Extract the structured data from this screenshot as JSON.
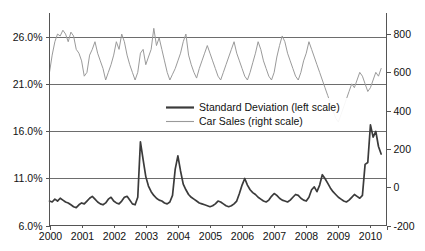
{
  "chart_data": {
    "type": "line",
    "title": "",
    "subtitle": "",
    "xlabel": "",
    "ylabel": "",
    "grid": true,
    "legend_position": "center",
    "x_tick_labels": [
      "2000",
      "2001",
      "2002",
      "2003",
      "2004",
      "2005",
      "2006",
      "2007",
      "2008",
      "2009",
      "2010"
    ],
    "x_tick_values": [
      2000,
      2001,
      2002,
      2003,
      2004,
      2005,
      2006,
      2007,
      2008,
      2009,
      2010
    ],
    "xlim": [
      2000.0,
      2010.5
    ],
    "left_axis": {
      "label": "",
      "ylim": [
        6.0,
        28.6
      ],
      "tick_labels": [
        "6.0%",
        "11.0%",
        "16.0%",
        "21.0%",
        "26.0%"
      ],
      "tick_values": [
        6.0,
        11.0,
        16.0,
        21.0,
        26.0
      ],
      "units": "percent"
    },
    "right_axis": {
      "label": "",
      "ylim": [
        -200,
        910
      ],
      "tick_labels": [
        "-200",
        "0",
        "200",
        "400",
        "600",
        "800"
      ],
      "tick_values": [
        -200,
        0,
        200,
        400,
        600,
        800
      ],
      "units": "thousands"
    },
    "series": [
      {
        "name": "Standard Deviation (left scale)",
        "axis": "left",
        "color": "#3b3b3b",
        "line_width": 1.7,
        "x": [
          2000.0,
          2000.083,
          2000.167,
          2000.25,
          2000.333,
          2000.417,
          2000.5,
          2000.583,
          2000.667,
          2000.75,
          2000.833,
          2000.917,
          2001.0,
          2001.083,
          2001.167,
          2001.25,
          2001.333,
          2001.417,
          2001.5,
          2001.583,
          2001.667,
          2001.75,
          2001.833,
          2001.917,
          2002.0,
          2002.083,
          2002.167,
          2002.25,
          2002.333,
          2002.417,
          2002.5,
          2002.583,
          2002.667,
          2002.75,
          2002.833,
          2002.917,
          2003.0,
          2003.083,
          2003.167,
          2003.25,
          2003.333,
          2003.417,
          2003.5,
          2003.583,
          2003.667,
          2003.75,
          2003.833,
          2003.917,
          2004.0,
          2004.083,
          2004.167,
          2004.25,
          2004.333,
          2004.417,
          2004.5,
          2004.583,
          2004.667,
          2004.75,
          2004.833,
          2004.917,
          2005.0,
          2005.083,
          2005.167,
          2005.25,
          2005.333,
          2005.417,
          2005.5,
          2005.583,
          2005.667,
          2005.75,
          2005.833,
          2005.917,
          2006.0,
          2006.083,
          2006.167,
          2006.25,
          2006.333,
          2006.417,
          2006.5,
          2006.583,
          2006.667,
          2006.75,
          2006.833,
          2006.917,
          2007.0,
          2007.083,
          2007.167,
          2007.25,
          2007.333,
          2007.417,
          2007.5,
          2007.583,
          2007.667,
          2007.75,
          2007.833,
          2007.917,
          2008.0,
          2008.083,
          2008.167,
          2008.25,
          2008.333,
          2008.417,
          2008.5,
          2008.583,
          2008.667,
          2008.75,
          2008.833,
          2008.917,
          2009.0,
          2009.083,
          2009.167,
          2009.25,
          2009.333,
          2009.417,
          2009.5,
          2009.583,
          2009.667,
          2009.75,
          2009.833,
          2009.917,
          2010.0,
          2010.083,
          2010.167,
          2010.25,
          2010.333
        ],
        "values": [
          8.6,
          8.5,
          8.8,
          8.6,
          8.9,
          8.7,
          8.5,
          8.4,
          8.2,
          8.0,
          7.9,
          8.2,
          8.4,
          8.3,
          8.6,
          8.9,
          9.1,
          8.8,
          8.5,
          8.3,
          8.2,
          8.4,
          8.8,
          9.0,
          8.6,
          8.4,
          8.3,
          8.6,
          9.0,
          9.1,
          8.7,
          8.3,
          8.2,
          9.0,
          14.9,
          13.0,
          11.2,
          10.2,
          9.6,
          9.2,
          8.9,
          8.7,
          8.6,
          8.4,
          8.3,
          8.5,
          9.2,
          12.0,
          13.4,
          11.8,
          10.4,
          9.8,
          9.3,
          9.0,
          8.8,
          8.6,
          8.4,
          8.3,
          8.2,
          8.1,
          8.0,
          8.1,
          8.3,
          8.6,
          8.5,
          8.3,
          8.1,
          8.0,
          8.1,
          8.3,
          8.6,
          9.4,
          10.3,
          11.0,
          10.3,
          9.8,
          9.5,
          9.3,
          9.0,
          8.8,
          8.6,
          8.5,
          8.7,
          9.1,
          9.4,
          9.2,
          8.9,
          8.7,
          8.6,
          8.5,
          8.7,
          9.0,
          9.3,
          9.2,
          8.9,
          8.7,
          8.6,
          9.0,
          9.8,
          10.1,
          9.6,
          10.3,
          11.4,
          11.0,
          10.5,
          10.0,
          9.6,
          9.3,
          9.0,
          8.8,
          8.6,
          8.5,
          8.7,
          9.0,
          9.3,
          9.1,
          8.9,
          9.2,
          12.5,
          12.7,
          16.7,
          15.4,
          16.0,
          14.4,
          13.6
        ]
      },
      {
        "name": "Car Sales (right scale)",
        "axis": "right",
        "color": "#9a9a9a",
        "line_width": 1.0,
        "x": [
          2000.0,
          2000.083,
          2000.167,
          2000.25,
          2000.333,
          2000.417,
          2000.5,
          2000.583,
          2000.667,
          2000.75,
          2000.833,
          2000.917,
          2001.0,
          2001.083,
          2001.167,
          2001.25,
          2001.333,
          2001.417,
          2001.5,
          2001.583,
          2001.667,
          2001.75,
          2001.833,
          2001.917,
          2002.0,
          2002.083,
          2002.167,
          2002.25,
          2002.333,
          2002.417,
          2002.5,
          2002.583,
          2002.667,
          2002.75,
          2002.833,
          2002.917,
          2003.0,
          2003.083,
          2003.167,
          2003.25,
          2003.333,
          2003.417,
          2003.5,
          2003.583,
          2003.667,
          2003.75,
          2003.833,
          2003.917,
          2004.0,
          2004.083,
          2004.167,
          2004.25,
          2004.333,
          2004.417,
          2004.5,
          2004.583,
          2004.667,
          2004.75,
          2004.833,
          2004.917,
          2005.0,
          2005.083,
          2005.167,
          2005.25,
          2005.333,
          2005.417,
          2005.5,
          2005.583,
          2005.667,
          2005.75,
          2005.833,
          2005.917,
          2006.0,
          2006.083,
          2006.167,
          2006.25,
          2006.333,
          2006.417,
          2006.5,
          2006.583,
          2006.667,
          2006.75,
          2006.833,
          2006.917,
          2007.0,
          2007.083,
          2007.167,
          2007.25,
          2007.333,
          2007.417,
          2007.5,
          2007.583,
          2007.667,
          2007.75,
          2007.833,
          2007.917,
          2008.0,
          2008.083,
          2008.167,
          2008.25,
          2008.333,
          2008.417,
          2008.5,
          2008.583,
          2008.667,
          2008.75,
          2008.833,
          2008.917,
          2009.0,
          2009.083,
          2009.167,
          2009.25,
          2009.333,
          2009.417,
          2009.5,
          2009.583,
          2009.667,
          2009.75,
          2009.833,
          2009.917,
          2010.0,
          2010.083,
          2010.167,
          2010.25,
          2010.333
        ],
        "values": [
          600,
          690,
          760,
          800,
          790,
          820,
          800,
          760,
          810,
          790,
          720,
          700,
          660,
          580,
          600,
          690,
          720,
          760,
          700,
          660,
          620,
          560,
          600,
          640,
          690,
          760,
          720,
          800,
          760,
          690,
          640,
          600,
          560,
          600,
          700,
          720,
          640,
          680,
          720,
          830,
          740,
          780,
          720,
          660,
          600,
          560,
          590,
          620,
          660,
          700,
          760,
          800,
          690,
          640,
          600,
          570,
          620,
          660,
          700,
          740,
          700,
          660,
          620,
          580,
          560,
          600,
          640,
          680,
          720,
          760,
          700,
          660,
          620,
          580,
          560,
          600,
          650,
          700,
          760,
          720,
          660,
          620,
          580,
          560,
          600,
          680,
          740,
          790,
          760,
          700,
          660,
          620,
          580,
          560,
          600,
          660,
          700,
          760,
          720,
          680,
          640,
          600,
          560,
          520,
          480,
          440,
          400,
          360,
          340,
          380,
          420,
          460,
          500,
          540,
          520,
          560,
          600,
          580,
          540,
          500,
          520,
          560,
          600,
          580,
          620
        ]
      }
    ]
  },
  "legend": {
    "items": [
      {
        "label": "Standard Deviation (left scale)",
        "color": "#3b3b3b",
        "thick": true
      },
      {
        "label": "Car Sales (right scale)",
        "color": "#9a9a9a",
        "thick": false
      }
    ]
  },
  "axis_labels": {
    "left": [
      "26.0%",
      "21.0%",
      "16.0%",
      "11.0%",
      "6.0%"
    ],
    "right": [
      "800",
      "600",
      "400",
      "200",
      "0",
      "-200"
    ],
    "bottom": [
      "2000",
      "2001",
      "2002",
      "2003",
      "2004",
      "2005",
      "2006",
      "2007",
      "2008",
      "2009",
      "2010"
    ]
  },
  "colors": {
    "standard_deviation": "#3b3b3b",
    "car_sales": "#9a9a9a",
    "gridline": "#6d6d6d",
    "axis": "#555555",
    "background": "#ffffff",
    "text": "#111111"
  }
}
